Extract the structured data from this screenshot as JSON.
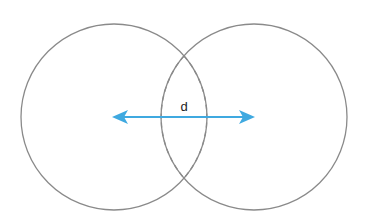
{
  "diagram": {
    "label_distance": "d",
    "colors": {
      "circle_stroke": "#8a8a8a",
      "arrow": "#3fa9e0",
      "label": "#222222"
    },
    "elements": [
      {
        "name": "left-circle",
        "style": "solid"
      },
      {
        "name": "right-circle",
        "style": "solid"
      },
      {
        "name": "overlap-region",
        "style": "dashed"
      },
      {
        "name": "distance-arrow",
        "style": "double-headed"
      }
    ]
  }
}
